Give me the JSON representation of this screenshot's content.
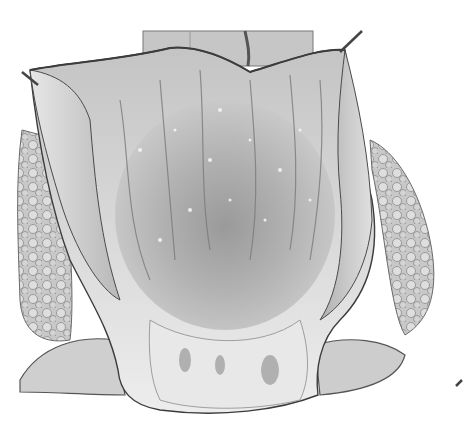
{
  "image": {
    "type": "grayscale anatomical illustration",
    "subject": "opened hollow organ with mucosal lining, retracted walls, and surrounding lobulated tissue",
    "colors": {
      "background": "#ffffff",
      "lining_light": "#d9d9d9",
      "lining_mid": "#b4b4b4",
      "lining_dark": "#7a7a7a",
      "outline": "#3c3c3c",
      "highlight": "#f4f4f4"
    }
  }
}
